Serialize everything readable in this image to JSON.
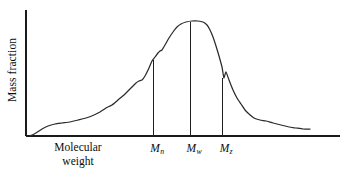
{
  "figure": {
    "name": "molecular-weight-distribution",
    "background_color": "#ffffff",
    "line_color": "#2b2b2b",
    "axis_color": "#1a1a1a",
    "text_color": "#0d0d0d"
  },
  "axes": {
    "ylabel": "Mass fraction",
    "xlabel_line1": "Molecular",
    "xlabel_line2": "weight",
    "x_axis": {
      "x1": 26,
      "y1": 136,
      "x2": 340,
      "y2": 136
    },
    "y_axis": {
      "x1": 26,
      "y1": 10,
      "x2": 26,
      "y2": 136
    }
  },
  "markers": [
    {
      "id": "Mn",
      "symbol": "M",
      "subscript": "n",
      "label": "Mn",
      "x": 153,
      "y_top": 60
    },
    {
      "id": "Mw",
      "symbol": "M",
      "subscript": "w",
      "label": "Mw",
      "x": 190,
      "y_top": 22
    },
    {
      "id": "Mz",
      "symbol": "M",
      "subscript": "z",
      "label": "Mz",
      "x": 222,
      "y_top": 78
    }
  ],
  "chart_data": {
    "type": "line",
    "title": "",
    "subtitle": "",
    "xlabel": "Molecular weight",
    "ylabel": "Mass fraction",
    "grid": false,
    "legend": null,
    "axis_ticks": {
      "x": [],
      "y": []
    },
    "annotations": [
      {
        "text": "Mn",
        "type": "vertical-marker",
        "x_pixel": 153,
        "description": "number-average molecular weight"
      },
      {
        "text": "Mw",
        "type": "vertical-marker",
        "x_pixel": 190,
        "description": "weight-average molecular weight"
      },
      {
        "text": "Mz",
        "type": "vertical-marker",
        "x_pixel": 222,
        "description": "z-average molecular weight"
      }
    ],
    "series": [
      {
        "name": "mass fraction distribution",
        "color": "#2b2b2b",
        "points": [
          [
            30,
            136
          ],
          [
            36,
            133
          ],
          [
            42,
            129
          ],
          [
            48,
            126
          ],
          [
            55,
            124
          ],
          [
            62,
            123
          ],
          [
            70,
            122
          ],
          [
            78,
            120
          ],
          [
            86,
            118
          ],
          [
            94,
            115
          ],
          [
            100,
            112
          ],
          [
            106,
            108
          ],
          [
            112,
            105
          ],
          [
            118,
            100
          ],
          [
            124,
            95
          ],
          [
            129,
            90
          ],
          [
            133,
            86
          ],
          [
            136,
            83
          ],
          [
            139,
            81
          ],
          [
            142,
            80
          ],
          [
            145,
            76
          ],
          [
            149,
            68
          ],
          [
            152,
            61
          ],
          [
            155,
            57
          ],
          [
            158,
            53
          ],
          [
            160,
            51
          ],
          [
            162,
            50
          ],
          [
            165,
            45
          ],
          [
            169,
            38
          ],
          [
            173,
            32
          ],
          [
            177,
            27
          ],
          [
            181,
            24
          ],
          [
            186,
            22
          ],
          [
            192,
            21
          ],
          [
            198,
            21
          ],
          [
            203,
            22
          ],
          [
            207,
            25
          ],
          [
            210,
            30
          ],
          [
            213,
            37
          ],
          [
            216,
            46
          ],
          [
            219,
            56
          ],
          [
            222,
            67
          ],
          [
            223,
            73
          ],
          [
            224,
            78
          ],
          [
            226,
            72
          ],
          [
            229,
            80
          ],
          [
            233,
            90
          ],
          [
            237,
            98
          ],
          [
            241,
            104
          ],
          [
            245,
            110
          ],
          [
            249,
            114
          ],
          [
            254,
            118
          ],
          [
            260,
            120
          ],
          [
            266,
            121
          ],
          [
            273,
            123
          ],
          [
            281,
            125
          ],
          [
            289,
            127
          ],
          [
            296,
            128
          ],
          [
            303,
            129
          ],
          [
            310,
            129
          ]
        ],
        "shape_description": "broad right-skewed unimodal molecular weight distribution curve with flat low tail, steep rise, rounded plateau peak, steep fall, and long flat high tail"
      }
    ]
  }
}
